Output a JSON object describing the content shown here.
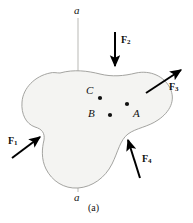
{
  "figure": {
    "caption": "(a)",
    "background_color": "#ffffff",
    "body": {
      "name": "rigid-body-blob",
      "fill_color": "#f4f4f2",
      "stroke_color": "#9a9a96"
    },
    "axis": {
      "label_top": "a",
      "label_bottom": "a",
      "stroke_color": "#b9b9b5",
      "x": 78,
      "y_top": 18,
      "y_bottom": 192
    },
    "points": [
      {
        "label": "A",
        "cx": 127,
        "cy": 104,
        "label_x": 133,
        "label_y": 108
      },
      {
        "label": "B",
        "cx": 110,
        "cy": 115,
        "label_x": 88,
        "label_y": 109
      },
      {
        "label": "C",
        "cx": 100,
        "cy": 98,
        "label_x": 86,
        "label_y": 86
      }
    ],
    "forces": [
      {
        "name": "force-1",
        "label": "F",
        "subscript": "1",
        "label_x": 8,
        "label_y": 137,
        "tail_x": 12,
        "tail_y": 158,
        "head_x": 42,
        "head_y": 135,
        "color": "#000000"
      },
      {
        "name": "force-2",
        "label": "F",
        "subscript": "2",
        "label_x": 122,
        "label_y": 36,
        "tail_x": 115,
        "tail_y": 32,
        "head_x": 115,
        "head_y": 70,
        "color": "#000000"
      },
      {
        "name": "force-3",
        "label": "F",
        "subscript": "3",
        "label_x": 171,
        "label_y": 83,
        "tail_x": 146,
        "tail_y": 93,
        "head_x": 184,
        "head_y": 68,
        "color": "#000000"
      },
      {
        "name": "force-4",
        "label": "F",
        "subscript": "4",
        "label_x": 143,
        "label_y": 155,
        "tail_x": 140,
        "tail_y": 178,
        "head_x": 127,
        "head_y": 136,
        "color": "#000000"
      }
    ]
  }
}
